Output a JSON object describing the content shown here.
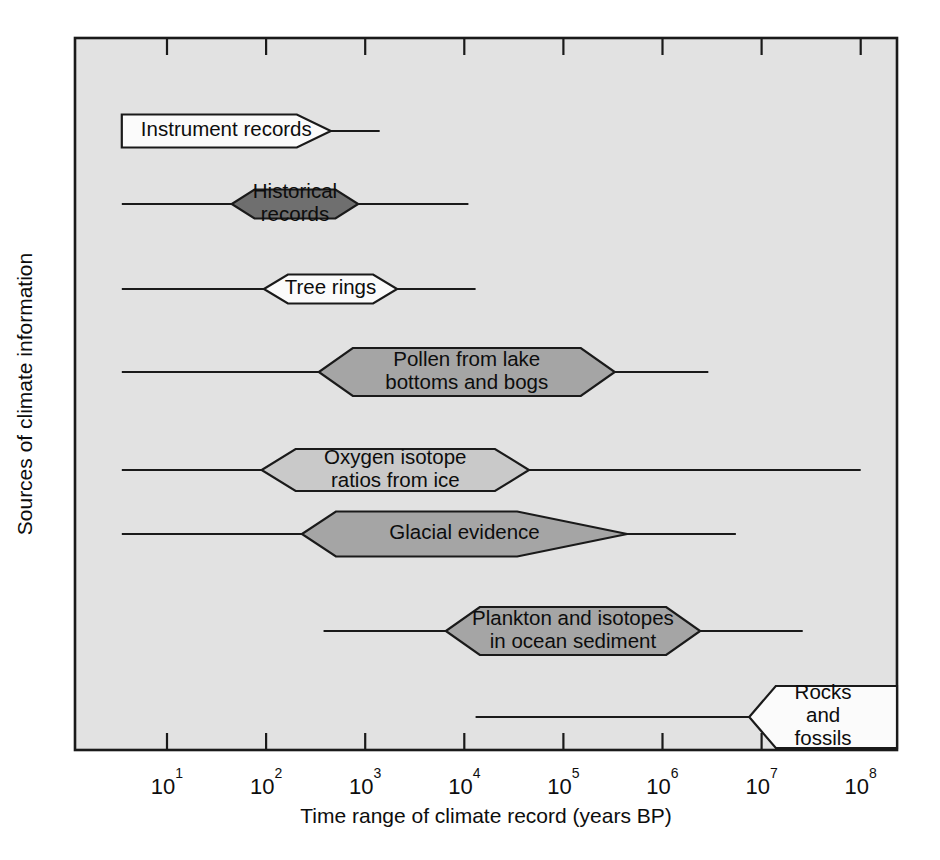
{
  "chart_data": {
    "type": "bar",
    "title": "",
    "xlabel": "Time range of climate record (years BP)",
    "ylabel": "Sources of climate information",
    "xscale": "log",
    "xlim": [
      3.5,
      300000000
    ],
    "xtick_labels": [
      "10",
      "10",
      "10",
      "10",
      "10",
      "10",
      "10",
      "10"
    ],
    "xtick_exponents": [
      "1",
      "2",
      "3",
      "4",
      "5",
      "6",
      "7",
      "8"
    ],
    "xtick_values": [
      10,
      100,
      1000,
      10000,
      100000,
      1000000,
      10000000,
      100000000
    ],
    "grid": false,
    "legend": "none",
    "categories": [
      "Instrument records",
      "Historical records",
      "Tree rings",
      "Pollen from lake bottoms and bogs",
      "Oxygen isotope ratios from ice",
      "Glacial evidence",
      "Plankton and isotopes in ocean sediment",
      "Rocks and fossils"
    ],
    "bars": [
      {
        "label": "Instrument records",
        "label_lines": [
          "Instrument records"
        ],
        "shade": "white",
        "shade_hex": "#fbfbfb",
        "box_start": 3.5,
        "box_end": 450,
        "tail_start": 3.5,
        "tail_end": 1400,
        "left_cap": "flat",
        "right_cap": "point"
      },
      {
        "label": "Historical records",
        "label_lines": [
          "Historical",
          "records"
        ],
        "shade": "dark",
        "shade_hex": "#6f6f6f",
        "box_start": 45,
        "box_end": 850,
        "tail_start": 3.5,
        "tail_end": 11000,
        "left_cap": "point",
        "right_cap": "point"
      },
      {
        "label": "Tree rings",
        "label_lines": [
          "Tree rings"
        ],
        "shade": "white",
        "shade_hex": "#fbfbfb",
        "box_start": 95,
        "box_end": 2100,
        "tail_start": 3.5,
        "tail_end": 13000,
        "left_cap": "point",
        "right_cap": "point"
      },
      {
        "label": "Pollen from lake bottoms and bogs",
        "label_lines": [
          "Pollen from lake",
          "bottoms and bogs"
        ],
        "shade": "medium",
        "shade_hex": "#a5a5a5",
        "box_start": 340,
        "box_end": 330000,
        "tail_start": 3.5,
        "tail_end": 2900000,
        "left_cap": "point",
        "right_cap": "point"
      },
      {
        "label": "Oxygen isotope ratios from ice",
        "label_lines": [
          "Oxygen isotope",
          "ratios from ice"
        ],
        "shade": "light",
        "shade_hex": "#c9c9c9",
        "box_start": 90,
        "box_end": 45000,
        "tail_start": 3.5,
        "tail_end": 100000000,
        "left_cap": "point",
        "right_cap": "point"
      },
      {
        "label": "Glacial evidence",
        "label_lines": [
          "Glacial evidence"
        ],
        "shade": "medium",
        "shade_hex": "#a5a5a5",
        "box_start": 230,
        "box_end": 440000,
        "tail_start": 3.5,
        "tail_end": 5500000,
        "left_cap": "point",
        "right_cap": "longpoint"
      },
      {
        "label": "Plankton and isotopes in ocean sediment",
        "label_lines": [
          "Plankton and isotopes",
          "in ocean sediment"
        ],
        "shade": "medium",
        "shade_hex": "#a5a5a5",
        "box_start": 6500,
        "box_end": 2400000,
        "tail_start": 380,
        "tail_end": 26000000,
        "left_cap": "point",
        "right_cap": "point"
      },
      {
        "label": "Rocks and fossils",
        "label_lines": [
          "Rocks",
          "and",
          "fossils"
        ],
        "shade": "white",
        "shade_hex": "#fbfbfb",
        "box_start": 7500000,
        "box_end": 300000000,
        "tail_start": 13000,
        "tail_end": 8500000,
        "left_cap": "point",
        "right_cap": "flat"
      }
    ]
  },
  "colors": {
    "plot_background": "#e2e2e2",
    "outline": "#1a1a1a",
    "page_background": "#ffffff"
  }
}
